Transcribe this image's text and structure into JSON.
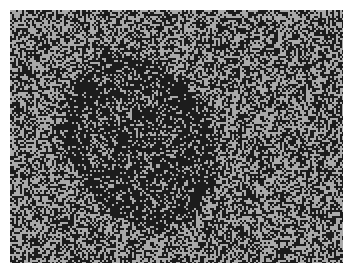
{
  "image": {
    "description": "Random-dot noise field with a darker tilted oval figure",
    "panel": {
      "x": 10,
      "y": 10,
      "width": 333,
      "height": 253
    },
    "colors": {
      "page_background": "#ffffff",
      "noise_light": "#a9a9a9",
      "noise_dark": "#1c1c1c"
    },
    "background_dark_density": 0.5,
    "figure": {
      "shape": "ellipse",
      "center_x": 128,
      "center_y": 130,
      "radius_x": 68,
      "radius_y": 88,
      "rotation_deg": -28,
      "dark_density": 0.74,
      "rim_dark_density": 0.84
    },
    "dot_size": 2
  }
}
